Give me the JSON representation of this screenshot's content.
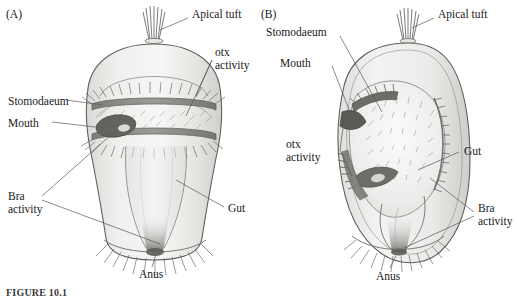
{
  "figure": {
    "caption": "FIGURE 10.1",
    "panels": [
      {
        "id": "(A)",
        "name": "panel-a",
        "view": "external lateral view of ciliated larva",
        "labels": [
          {
            "key": "apical_tuft",
            "text": "Apical tuft",
            "italic_part": "",
            "x": 192,
            "y": 14
          },
          {
            "key": "otx_activity",
            "text_line1": "otx",
            "text_line2": "activity",
            "x": 215,
            "y": 52
          },
          {
            "key": "stomodaeum",
            "text": "Stomodaeum",
            "x": 8,
            "y": 95
          },
          {
            "key": "mouth",
            "text": "Mouth",
            "x": 8,
            "y": 117
          },
          {
            "key": "bra_activity",
            "text_line1": "Bra",
            "text_line2": "activity",
            "x": 8,
            "y": 192
          },
          {
            "key": "gut",
            "text": "Gut",
            "x": 226,
            "y": 204
          },
          {
            "key": "anus",
            "text": "Anus",
            "x": 139,
            "y": 270
          }
        ]
      },
      {
        "id": "(B)",
        "name": "panel-b",
        "view": "cutaway sagittal view showing gut and ciliated bands",
        "labels": [
          {
            "key": "apical_tuft",
            "text": "Apical tuft",
            "x": 438,
            "y": 14
          },
          {
            "key": "stomodaeum",
            "text": "Stomodaeum",
            "x": 268,
            "y": 31
          },
          {
            "key": "mouth",
            "text": "Mouth",
            "x": 280,
            "y": 61
          },
          {
            "key": "otx_activity",
            "text_line1": "otx",
            "text_line2": "activity",
            "x": 288,
            "y": 142
          },
          {
            "key": "gut",
            "text": "Gut",
            "x": 462,
            "y": 147
          },
          {
            "key": "bra_activity",
            "text_line1": "Bra",
            "text_line2": "activity",
            "x": 478,
            "y": 206
          },
          {
            "key": "anus",
            "text": "Anus",
            "x": 376,
            "y": 272
          }
        ]
      }
    ],
    "genes": [
      {
        "symbol": "otx",
        "label": "otx activity",
        "style": "italic-symbol"
      },
      {
        "symbol": "Bra",
        "label": "Bra activity",
        "style": "italic-symbol"
      }
    ],
    "anatomy_terms": [
      "Apical tuft",
      "Stomodaeum",
      "Mouth",
      "Gut",
      "Anus"
    ],
    "colors": {
      "ink": "#202020",
      "leader_line": "#4a4a4a",
      "body_fill_light": "#f2f2f1",
      "body_fill_mid": "#e2e2e0",
      "body_shade": "#cfcfcc",
      "cilia_band": "#8d8d8a",
      "dark_band": "#6f6f6d",
      "mouth_dark": "#5e5e5c",
      "background": "#ffffff"
    }
  }
}
